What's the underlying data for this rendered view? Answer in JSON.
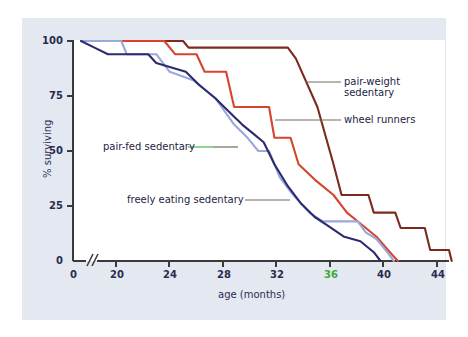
{
  "figure": {
    "background": "#ffffff",
    "panel_color": "#e4e9f1",
    "plot_background": "#ffffff"
  },
  "chart_data": {
    "type": "line",
    "title": "",
    "xlabel": "age (months)",
    "ylabel": "% surviving",
    "xlim": [
      18,
      46
    ],
    "ylim": [
      0,
      100
    ],
    "grid": false,
    "legend_position": "inline-annotations",
    "axis_break": true,
    "axis_break_label": "0",
    "xticks": [
      20,
      24,
      28,
      32,
      36,
      40,
      44
    ],
    "xticklabels": [
      "20",
      "24",
      "28",
      "32",
      "36",
      "40",
      "44"
    ],
    "xtick_highlight": "36",
    "yticks": [
      0,
      25,
      50,
      75,
      100
    ],
    "yticklabels": [
      "0",
      "25",
      "50",
      "75",
      "100"
    ],
    "series": [
      {
        "name": "pair-weight sedentary",
        "color": "#7d2a1e",
        "points": [
          [
            18.6,
            100
          ],
          [
            26.2,
            100
          ],
          [
            26.6,
            97
          ],
          [
            34.0,
            97
          ],
          [
            34.6,
            92
          ],
          [
            36.2,
            70
          ],
          [
            37.4,
            44
          ],
          [
            38.0,
            30
          ],
          [
            40.0,
            30
          ],
          [
            40.4,
            22
          ],
          [
            42.0,
            22
          ],
          [
            42.4,
            15
          ],
          [
            44.2,
            15
          ],
          [
            44.6,
            5
          ],
          [
            46.0,
            5
          ],
          [
            46.2,
            0
          ]
        ]
      },
      {
        "name": "wheel runners",
        "color": "#d6442e",
        "points": [
          [
            18.6,
            100
          ],
          [
            24.8,
            100
          ],
          [
            25.6,
            94
          ],
          [
            27.2,
            94
          ],
          [
            27.8,
            86
          ],
          [
            29.4,
            86
          ],
          [
            30.0,
            70
          ],
          [
            32.6,
            70
          ],
          [
            33.0,
            56
          ],
          [
            34.2,
            56
          ],
          [
            34.8,
            44
          ],
          [
            36.0,
            37
          ],
          [
            37.4,
            30
          ],
          [
            38.4,
            22
          ],
          [
            39.6,
            16
          ],
          [
            40.6,
            11
          ],
          [
            41.6,
            4
          ],
          [
            42.2,
            0
          ]
        ]
      },
      {
        "name": "pair-fed sedentary",
        "color": "#9aa8dc",
        "points": [
          [
            18.6,
            100
          ],
          [
            21.6,
            100
          ],
          [
            22.0,
            94
          ],
          [
            24.2,
            94
          ],
          [
            25.2,
            86
          ],
          [
            27.0,
            82
          ],
          [
            28.6,
            74
          ],
          [
            30.0,
            62
          ],
          [
            31.0,
            56
          ],
          [
            31.8,
            50
          ],
          [
            32.6,
            50
          ],
          [
            33.4,
            38
          ],
          [
            34.4,
            30
          ],
          [
            35.6,
            22
          ],
          [
            36.6,
            18
          ],
          [
            39.2,
            18
          ],
          [
            39.8,
            13
          ],
          [
            40.6,
            10
          ],
          [
            41.4,
            4
          ],
          [
            41.9,
            0
          ]
        ]
      },
      {
        "name": "freely eating sedentary",
        "color": "#2b2b6e",
        "points": [
          [
            18.6,
            100
          ],
          [
            19.6,
            97
          ],
          [
            20.6,
            94
          ],
          [
            23.6,
            94
          ],
          [
            24.2,
            90
          ],
          [
            26.4,
            86
          ],
          [
            27.4,
            80
          ],
          [
            28.6,
            74
          ],
          [
            29.6,
            68
          ],
          [
            30.6,
            62
          ],
          [
            31.4,
            58
          ],
          [
            32.2,
            54
          ],
          [
            33.0,
            44
          ],
          [
            34.0,
            34
          ],
          [
            35.0,
            26
          ],
          [
            36.0,
            20
          ],
          [
            37.0,
            16
          ],
          [
            38.2,
            11
          ],
          [
            39.4,
            9
          ],
          [
            40.4,
            4
          ],
          [
            40.9,
            0
          ]
        ]
      }
    ],
    "annotations": [
      {
        "text_line1": "pair-weight",
        "text_line2": "sedentary",
        "target": "pair-weight sedentary"
      },
      {
        "text_line1": "wheel runners",
        "text_line2": "",
        "target": "wheel runners"
      },
      {
        "text_line1": "pair-fed sedentary",
        "text_line2": "",
        "target": "pair-fed sedentary"
      },
      {
        "text_line1": "freely eating sedentary",
        "text_line2": "",
        "target": "freely eating sedentary"
      }
    ]
  },
  "labels": {
    "y_axis_title": "% surviving",
    "x_axis_title": "age (months)",
    "x_origin": "0",
    "y_origin": "0",
    "xtick_20": "20",
    "xtick_24": "24",
    "xtick_28": "28",
    "xtick_32": "32",
    "xtick_36": "36",
    "xtick_40": "40",
    "xtick_44": "44",
    "ytick_0": "0",
    "ytick_25": "25",
    "ytick_50": "50",
    "ytick_75": "75",
    "ytick_100": "100",
    "ann_pw_l1": "pair-weight",
    "ann_pw_l2": "sedentary",
    "ann_wr": "wheel runners",
    "ann_pf": "pair-fed sedentary",
    "ann_fe": "freely eating sedentary"
  }
}
